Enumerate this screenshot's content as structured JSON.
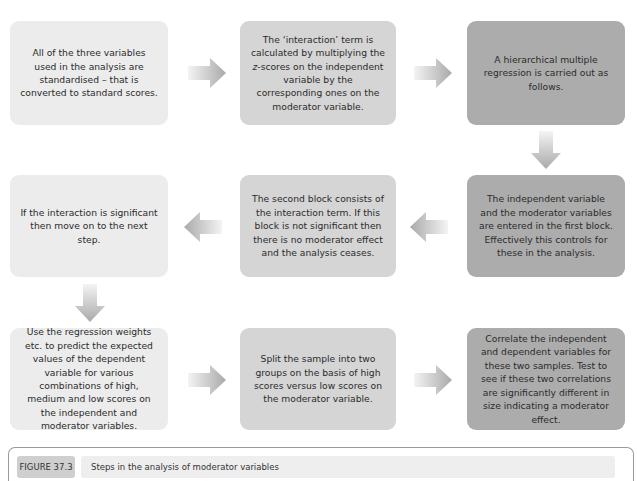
{
  "steps": [
    {
      "id": 1,
      "text": "All of the three variables used in the analysis are standardised – that is converted to standard scores."
    },
    {
      "id": 2,
      "text_before": "The ‘interaction’ term is calculated by multiplying the ",
      "text_italic": "z",
      "text_after": "-scores on the independent variable by the corresponding ones on the moderator variable."
    },
    {
      "id": 3,
      "text": "A hierarchical multiple regression is carried out as follows."
    },
    {
      "id": 4,
      "text": "The independent variable and the moderator variables are entered in the first block. Effectively this controls for these in the analysis."
    },
    {
      "id": 5,
      "text": "The second block consists of the interaction term. If this block is not significant then there is no moderator effect and the analysis ceases."
    },
    {
      "id": 6,
      "text": "If the interaction is significant then move on to the next step."
    },
    {
      "id": 7,
      "text": "Use the regression weights etc. to predict the expected values of the dependent variable for various combinations of high, medium and low scores on the independent and moderator variables."
    },
    {
      "id": 8,
      "text": "Split the sample into two groups on the basis of high scores versus low scores on the moderator variable."
    },
    {
      "id": 9,
      "text": "Correlate the independent and dependent variables for these two samples. Test to see if these two correlations are significantly different in size indicating a moderator effect."
    }
  ],
  "arrows": [
    {
      "from": 1,
      "to": 2,
      "direction": "right"
    },
    {
      "from": 2,
      "to": 3,
      "direction": "right"
    },
    {
      "from": 3,
      "to": 4,
      "direction": "down"
    },
    {
      "from": 4,
      "to": 5,
      "direction": "left"
    },
    {
      "from": 5,
      "to": 6,
      "direction": "left"
    },
    {
      "from": 6,
      "to": 7,
      "direction": "down"
    },
    {
      "from": 7,
      "to": 8,
      "direction": "right"
    },
    {
      "from": 8,
      "to": 9,
      "direction": "right"
    }
  ],
  "colors": {
    "light": "#ececec",
    "medium": "#d5d5d5",
    "dark": "#acacac",
    "arrow": "#b5b5b5"
  },
  "caption": {
    "label": "FIGURE 37.3",
    "title": "Steps in the analysis of moderator variables"
  }
}
